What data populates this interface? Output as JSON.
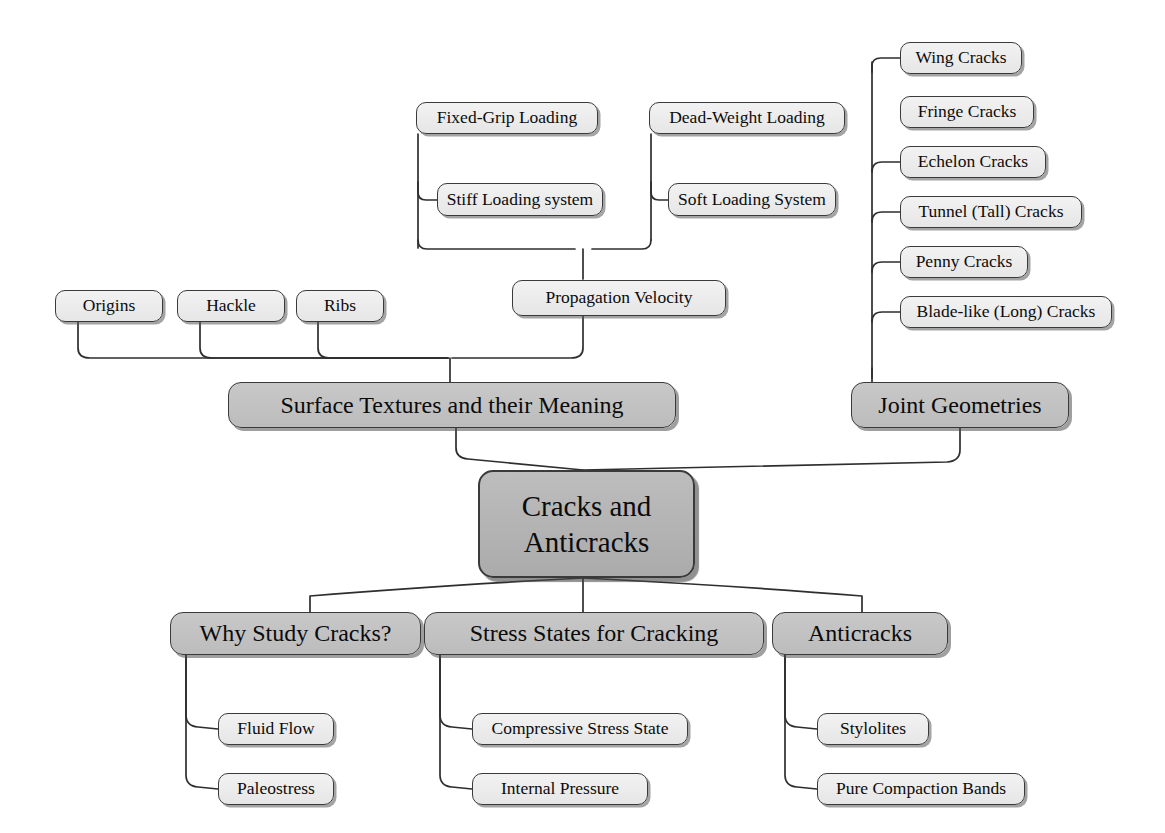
{
  "diagram": {
    "colors": {
      "leaf_fill": "#eeeeee",
      "mid_fill": "#c2c2c2",
      "hub_fill": "#b4b4b4",
      "stroke": "#3a3a3a",
      "background": "#ffffff"
    },
    "hub": {
      "line1": "Cracks and",
      "line2": "Anticracks"
    },
    "loading": [
      {
        "id": "fixed-grip-loading",
        "label": "Fixed-Grip Loading"
      },
      {
        "id": "dead-weight-loading",
        "label": "Dead-Weight Loading"
      },
      {
        "id": "stiff-loading-system",
        "label": "Stiff Loading system"
      },
      {
        "id": "soft-loading-system",
        "label": "Soft Loading System"
      }
    ],
    "propagation": {
      "id": "propagation-velocity",
      "label": "Propagation Velocity"
    },
    "surface_textures": {
      "id": "surface-textures-and-their-meaning",
      "label": "Surface Textures and their Meaning",
      "children": [
        {
          "id": "origins",
          "label": "Origins"
        },
        {
          "id": "hackle",
          "label": "Hackle"
        },
        {
          "id": "ribs",
          "label": "Ribs"
        }
      ]
    },
    "joint_geometries": {
      "id": "joint-geometries",
      "label": "Joint Geometries",
      "children": [
        {
          "id": "wing-cracks",
          "label": "Wing Cracks"
        },
        {
          "id": "fringe-cracks",
          "label": "Fringe Cracks"
        },
        {
          "id": "echelon-cracks",
          "label": "Echelon Cracks"
        },
        {
          "id": "tunnel-tall-cracks",
          "label": "Tunnel (Tall) Cracks"
        },
        {
          "id": "penny-cracks",
          "label": "Penny Cracks"
        },
        {
          "id": "blade-like-long-cracks",
          "label": "Blade-like (Long) Cracks"
        }
      ]
    },
    "branches": [
      {
        "id": "why-study-cracks",
        "label": "Why Study Cracks?",
        "children": [
          {
            "id": "fluid-flow",
            "label": "Fluid Flow"
          },
          {
            "id": "paleostress",
            "label": "Paleostress"
          }
        ]
      },
      {
        "id": "stress-states-for-cracking",
        "label": "Stress States for Cracking",
        "children": [
          {
            "id": "compressive-stress-state",
            "label": "Compressive Stress State"
          },
          {
            "id": "internal-pressure",
            "label": "Internal Pressure"
          }
        ]
      },
      {
        "id": "anticracks",
        "label": "Anticracks",
        "children": [
          {
            "id": "stylolites",
            "label": "Stylolites"
          },
          {
            "id": "pure-compaction-bands",
            "label": "Pure Compaction Bands"
          }
        ]
      }
    ]
  }
}
